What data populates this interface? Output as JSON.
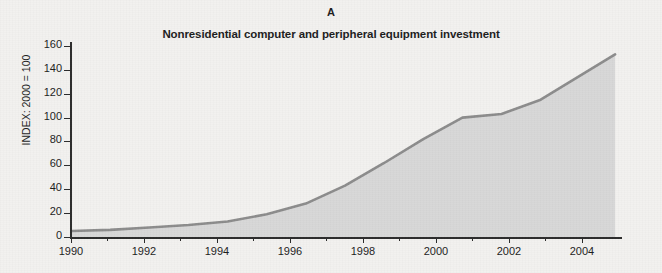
{
  "panel": {
    "label": "A",
    "title": "Nonresidential computer and peripheral equipment investment"
  },
  "axes": {
    "ylabel": "INDEX: 2000 = 100",
    "ytick_labels": [
      "0",
      "20",
      "40",
      "60",
      "80",
      "100",
      "120",
      "140",
      "160"
    ],
    "xtick_labels": [
      "1990",
      "1992",
      "1994",
      "1996",
      "1998",
      "2000",
      "2002",
      "2004"
    ]
  },
  "colors": {
    "line": "#8c8c8c",
    "fill": "#d8d8d8",
    "axis": "#2b2b2b",
    "text": "#1c1c1c",
    "background": "#f2f1ef"
  },
  "chart_data": {
    "type": "area",
    "title": "Nonresidential computer and peripheral equipment investment",
    "subtitle": "A",
    "xlabel": "",
    "ylabel": "INDEX: 2000 = 100",
    "xlim": [
      1990,
      2004
    ],
    "ylim": [
      0,
      170
    ],
    "yticks": [
      0,
      20,
      40,
      60,
      80,
      100,
      120,
      140,
      160
    ],
    "xticks": [
      1990,
      1992,
      1994,
      1996,
      1998,
      2000,
      2002,
      2004
    ],
    "xminor_ticks": [
      1991,
      1993,
      1995,
      1997,
      1999,
      2001,
      2003
    ],
    "grid": false,
    "legend": "none",
    "series": [
      {
        "name": "Nonresidential computer and peripheral equipment investment",
        "x": [
          1990,
          1991,
          1992,
          1993,
          1994,
          1995,
          1996,
          1997,
          1998,
          1999,
          2000,
          2001,
          2002,
          2003.9
        ],
        "values": [
          5,
          6,
          8,
          10,
          13,
          19,
          28,
          43,
          62,
          82,
          100,
          103,
          115,
          153
        ]
      }
    ]
  }
}
